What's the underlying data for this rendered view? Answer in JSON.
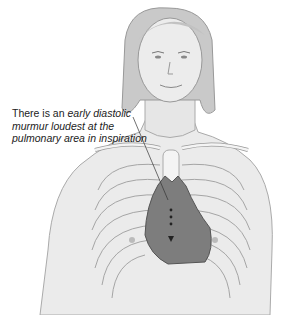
{
  "figure": {
    "annotation": {
      "prefix": "There is an ",
      "italic": "early diastolic murmur loudest at the pulmonary area in inspiration"
    },
    "colors": {
      "skin": "#ebebeb",
      "outline": "#9a9a9a",
      "hair": "#c8c8c8",
      "heart": "#7d7d7d",
      "bone": "#f4f4f4"
    }
  }
}
